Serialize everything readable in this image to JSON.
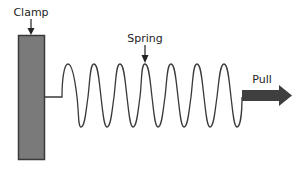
{
  "diagram": {
    "labels": {
      "clamp": "Clamp",
      "spring": "Spring",
      "pull": "Pull"
    },
    "colors": {
      "clamp_fill": "#7a7a7a",
      "clamp_stroke": "#3a3a3a",
      "spring_stroke": "#3a3a3a",
      "arrow_fill": "#3f3f3f",
      "text": "#222222"
    },
    "spring": {
      "coils": 7,
      "peak_y": 64,
      "trough_y": 127,
      "baseline_y": 97
    }
  }
}
